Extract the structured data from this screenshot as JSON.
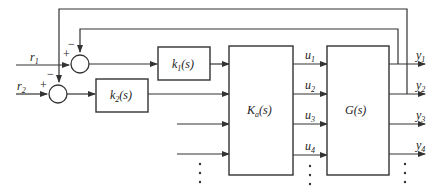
{
  "diagram": {
    "inputs": [
      {
        "name": "r",
        "sub": "1"
      },
      {
        "name": "r",
        "sub": "2"
      }
    ],
    "junctions": [
      {
        "id": "sum1",
        "plus": "+",
        "minus": "−"
      },
      {
        "id": "sum2",
        "plus": "+",
        "minus": "−"
      }
    ],
    "blocks": {
      "k1": {
        "name": "k",
        "sub": "1",
        "arg": "(s)"
      },
      "k2": {
        "name": "k",
        "sub": "2",
        "arg": "(s)"
      },
      "ka": {
        "name": "K",
        "sub": "a",
        "arg": "(s)"
      },
      "g": {
        "name": "G",
        "arg": "(s)"
      }
    },
    "controls": [
      {
        "name": "u",
        "sub": "1"
      },
      {
        "name": "u",
        "sub": "2"
      },
      {
        "name": "u",
        "sub": "3"
      },
      {
        "name": "u",
        "sub": "4"
      }
    ],
    "outputs": [
      {
        "name": "y",
        "sub": "1"
      },
      {
        "name": "y",
        "sub": "2"
      },
      {
        "name": "y",
        "sub": "3"
      },
      {
        "name": "y",
        "sub": "4"
      }
    ],
    "ellipsis": "⋮",
    "colors": {
      "line": "#333333",
      "text": "#222222",
      "background": "#ffffff"
    }
  }
}
